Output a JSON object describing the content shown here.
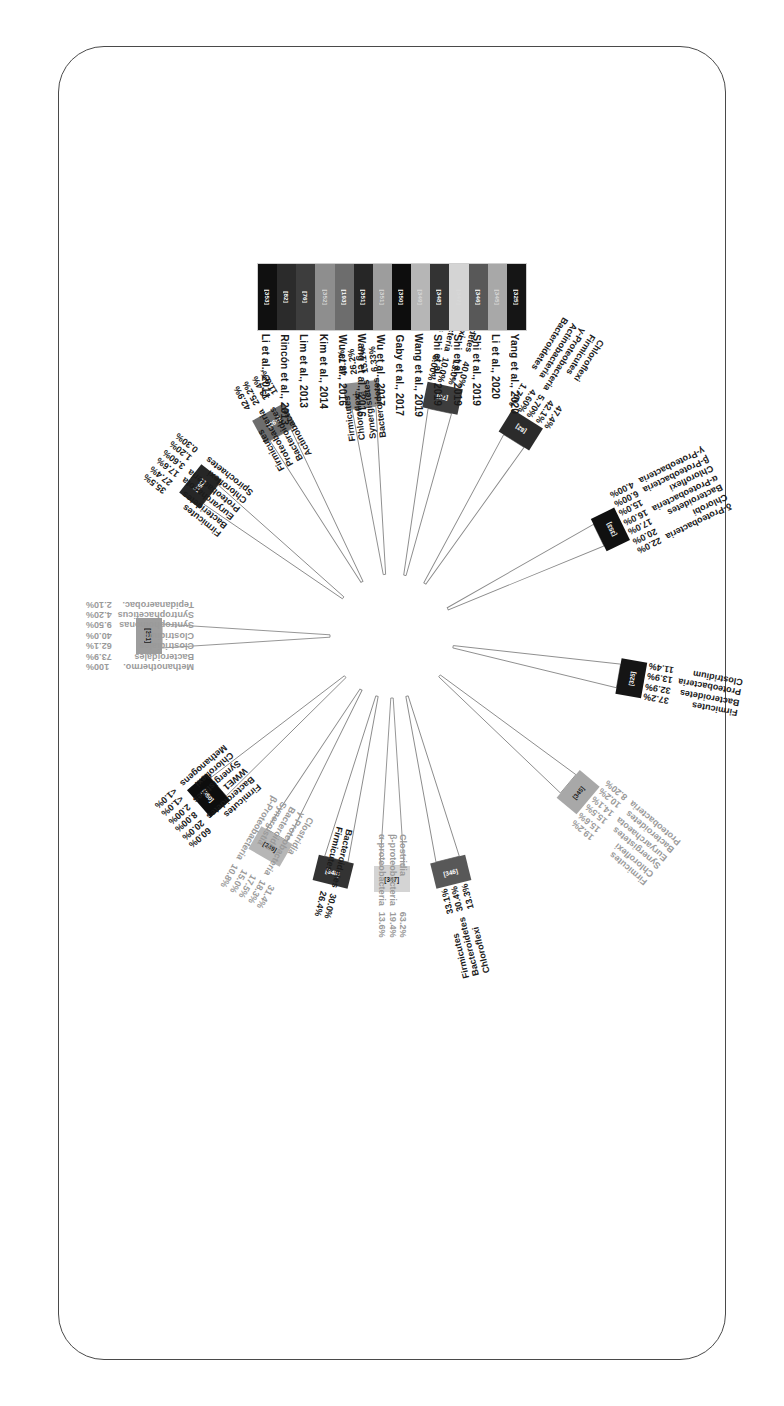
{
  "figure": {
    "type": "radial-wedge-diagram",
    "rotation_deg": 180,
    "frame": "rounded-rectangle-border"
  },
  "legend": {
    "entries": [
      {
        "ref": "[325]",
        "citation": "Yang et al., 2020",
        "color": "#151515"
      },
      {
        "ref": "[345]",
        "citation": "Li et al., 2020",
        "color": "#a8a8a8"
      },
      {
        "ref": "[346]",
        "citation": "Shi et al., 2019",
        "color": "#585858"
      },
      {
        "ref": "[347]",
        "citation": "Shi et al., 2019",
        "color": "#d4d4d4"
      },
      {
        "ref": "[348]",
        "citation": "Shi et al., 2019",
        "color": "#333333"
      },
      {
        "ref": "[349]",
        "citation": "Wang et al., 2019",
        "color": "#b6b6b6"
      },
      {
        "ref": "[350]",
        "citation": "Gaby et al., 2017",
        "color": "#0d0d0d"
      },
      {
        "ref": "[351]",
        "citation": "Wu et al., 2017",
        "color": "#9d9d9d"
      },
      {
        "ref": "[351]",
        "citation": "Wang et al., 2016",
        "color": "#262626"
      },
      {
        "ref": "[193]",
        "citation": "Wu et al., 2016",
        "color": "#6d6d6d"
      },
      {
        "ref": "[352]",
        "citation": "Kim et al., 2014",
        "color": "#8e8e8e"
      },
      {
        "ref": "[76]",
        "citation": "Lim et al., 2013",
        "color": "#3d3d3d"
      },
      {
        "ref": "[82]",
        "citation": "Rincón et al., 2013",
        "color": "#2b2b2b"
      },
      {
        "ref": "[353]",
        "citation": "Li et al., 2011",
        "color": "#101010"
      }
    ]
  },
  "chart_data": {
    "type": "bar",
    "title": "",
    "xlabel": "",
    "ylabel": "Relative abundance (%)",
    "ylim": [
      0,
      100
    ],
    "layout": "radial wedges arranged clockwise around a common center; each wedge carries a colored outer cap bar labelled with its reference number, followed by taxon-name / percentage pairs",
    "series": [
      {
        "ref": "[346]",
        "citation": "Shi et al., 2019",
        "color": "#585858",
        "angle_deg": 104,
        "categories": [
          "Firmicutes",
          "Bacteroidetes",
          "Chloroflexi"
        ],
        "values": [
          33.1,
          30.4,
          13.3
        ],
        "labels": [
          "33.1%",
          "30.4%",
          "13.3%"
        ]
      },
      {
        "ref": "[347]",
        "citation": "Shi et al., 2019",
        "color": "#d4d4d4",
        "angle_deg": 90,
        "categories": [
          "Clostridia",
          "β-proteobacteria",
          "α-proteobacteria"
        ],
        "values": [
          63.2,
          19.4,
          13.6
        ],
        "labels": [
          "63.2%",
          "19.4%",
          "13.6%"
        ]
      },
      {
        "ref": "[348]",
        "citation": "Shi et al., 2019",
        "color": "#333333",
        "angle_deg": 76,
        "categories": [
          "Bacteroidetes",
          "Firmicutes"
        ],
        "values": [
          30.0,
          26.4
        ],
        "labels": [
          "30.0%",
          "26.4%"
        ]
      },
      {
        "ref": "[349]",
        "citation": "Wang et al., 2019",
        "color": "#b6b6b6",
        "angle_deg": 60,
        "categories": [
          "Clostridia",
          "γ-Proteobacteria",
          "Bacteroidia",
          "Synergistia",
          "β-Proteobacteria"
        ],
        "values": [
          31.4,
          18.3,
          17.5,
          15.0,
          10.8
        ],
        "labels": [
          "31.4%",
          "18.3%",
          "17.5%",
          "15.0%",
          "10.8%"
        ]
      },
      {
        "ref": "[350]",
        "citation": "Gaby et al., 2017",
        "color": "#0d0d0d",
        "angle_deg": 41,
        "categories": [
          "Firmicutes",
          "Bacteroidetes",
          "WWE1",
          "Synergistetes",
          "Chloroflexi",
          "Methanogens"
        ],
        "values": [
          60.0,
          20.0,
          8.0,
          2.0,
          1.0,
          1.0
        ],
        "labels": [
          "60.0%",
          "20.0%",
          "8.00%",
          "2.00%",
          "<1.0%",
          "<1.0%"
        ]
      },
      {
        "ref": "[351]",
        "citation": "Wu et al., 2017",
        "color": "#9d9d9d",
        "angle_deg": 0,
        "categories": [
          "Methanothermo.",
          "Bacteroidales",
          "Clostridiales",
          "Clostridium",
          "Syntrophomonas",
          "Syntrophaceticus",
          "Tepidanaerobac."
        ],
        "values": [
          100.0,
          73.9,
          62.1,
          40.0,
          9.5,
          4.2,
          2.1
        ],
        "labels": [
          "100%",
          "73.9%",
          "62.1%",
          "40.0%",
          "9.50%",
          "4.20%",
          "2.10%"
        ]
      },
      {
        "ref": "[351]",
        "citation": "Wang et al., 2016",
        "color": "#262626",
        "angle_deg": -38,
        "categories": [
          "Firmicutes",
          "Bacteridetes",
          "Euryarchaeota",
          "Proteobacteria",
          "Chloroflexi",
          "Spirochaetes"
        ],
        "values": [
          35.5,
          27.4,
          17.6,
          3.6,
          1.2,
          0.3
        ],
        "labels": [
          "35.5%",
          "27.4%",
          "17.6%",
          "3.60%",
          "1.20%",
          "0.30%"
        ]
      },
      {
        "ref": "[193]",
        "citation": "Wu et al., 2016",
        "color": "#6d6d6d",
        "angle_deg": -61,
        "categories": [
          "Firmicutes",
          "Proteobacteria",
          "Bacteroidetes",
          "Actinobacter"
        ],
        "values": [
          42.9,
          25.2,
          13.4,
          11.8
        ],
        "labels": [
          "42.9%",
          "25.2%",
          "13.4%",
          "11.8%"
        ]
      },
      {
        "ref": "[352]",
        "citation": "Kim et al., 2014",
        "color": "#8e8e8e",
        "angle_deg": -83,
        "categories": [
          "Firmicutes",
          "Chloroflexi",
          "Synergistetes",
          "Bacteroidetes"
        ],
        "values": [
          48.7,
          26.2,
          15.1,
          6.33
        ],
        "labels": [
          "48.7%",
          "26.2%",
          "15.1%",
          "6.33%"
        ]
      },
      {
        "ref": "[76]",
        "citation": "Lim et al., 2013",
        "color": "#3d3d3d",
        "angle_deg": -102,
        "categories": [
          "Bacteroidetes",
          "Chloroflexi",
          "Proteobacteria",
          "Firmicutes"
        ],
        "values": [
          40.0,
          13.0,
          10.0,
          8.0
        ],
        "labels": [
          "40.0%",
          "13.0%",
          "10.0%",
          "8.00%"
        ]
      },
      {
        "ref": "[82]",
        "citation": "Rincón et al., 2013",
        "color": "#2b2b2b",
        "angle_deg": -122,
        "categories": [
          "Chloroflexi",
          "Firmicutes",
          "γ-Proteobacteria",
          "Actinobacteria",
          "Bacteroidetes"
        ],
        "values": [
          47.4,
          42.1,
          5.7,
          4.6,
          1.7
        ],
        "labels": [
          "47.4%",
          "42.1%",
          "5.70%",
          "4.60%",
          "1.70%"
        ]
      },
      {
        "ref": "[353]",
        "citation": "Li et al., 2011",
        "color": "#101010",
        "angle_deg": -154,
        "categories": [
          "δ-Proteobacteria",
          "Chlorobi",
          "Bacteroidetes",
          "α-Proteobacteria",
          "Chloroflexi",
          "β-Proteobacteria",
          "γ-Proteobacteria"
        ],
        "values": [
          22.0,
          20.0,
          17.0,
          16.0,
          15.0,
          6.0,
          4.0
        ],
        "labels": [
          "22.0%",
          "20.0%",
          "17.0%",
          "16.0%",
          "15.0%",
          "6.00%",
          "4.00%"
        ]
      },
      {
        "ref": "[325]",
        "citation": "Yang et al., 2020",
        "color": "#151515",
        "angle_deg": 170,
        "categories": [
          "Firmicutes",
          "Bacteroidetes",
          "Proteobacteria",
          "Clostridium"
        ],
        "values": [
          37.2,
          32.9,
          13.9,
          11.4
        ],
        "labels": [
          "37.2%",
          "32.9%",
          "13.9%",
          "11.4%"
        ]
      },
      {
        "ref": "[345]",
        "citation": "Li et al., 2020",
        "color": "#a8a8a8",
        "angle_deg": 140,
        "categories": [
          "Firmicutes",
          "Chloroflexi",
          "Synergistetes",
          "Euryarchaeota",
          "Bacteroidetes",
          "Proteobacteria"
        ],
        "values": [
          19.2,
          15.6,
          15.5,
          14.1,
          10.2,
          8.2
        ],
        "labels": [
          "19.2%",
          "15.6%",
          "15.5%",
          "14.1%",
          "10.2%",
          "8.20%"
        ]
      }
    ]
  }
}
